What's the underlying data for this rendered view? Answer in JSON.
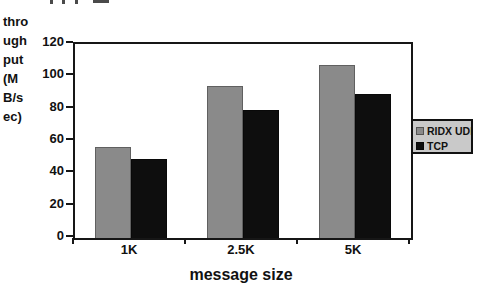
{
  "chart_data": {
    "type": "bar",
    "title": "",
    "categories": [
      "1K",
      "2.5K",
      "5K"
    ],
    "series": [
      {
        "name": "RIDX UDP",
        "color": "#8a8a8a",
        "values": [
          56,
          94,
          107
        ]
      },
      {
        "name": "TCP",
        "color": "#0e0e0e",
        "values": [
          49,
          79,
          89
        ]
      }
    ],
    "xlabel": "message size",
    "ylabel": "throughput (MB/sec)",
    "ylabel_display_lines": [
      "thro",
      "ugh",
      "put",
      "(M",
      "B/s",
      "ec)"
    ],
    "ylim": [
      0,
      120
    ],
    "yticks": [
      120,
      100,
      80,
      60,
      40,
      20,
      0
    ],
    "grid": false,
    "legend_position": "right",
    "legend_background": "#c9c9c9",
    "axis_color": "#161616"
  }
}
